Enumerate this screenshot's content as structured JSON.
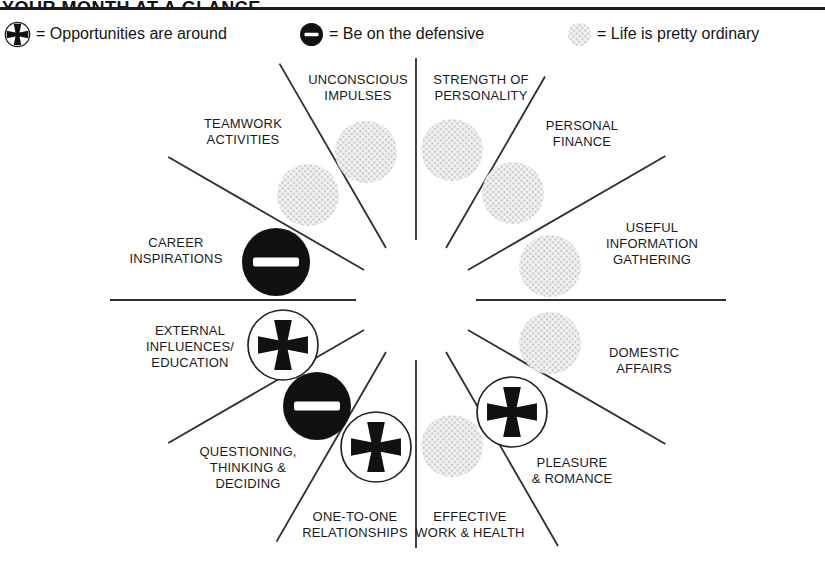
{
  "title": "YOUR MONTH AT A GLANCE",
  "legend": [
    {
      "icon": "plus-circle-icon",
      "meaning": "plus",
      "text": "= Opportunities are around"
    },
    {
      "icon": "minus-circle-icon",
      "meaning": "minus",
      "text": "= Be on the defensive"
    },
    {
      "icon": "ordinary-circle-icon",
      "meaning": "ordinary",
      "text": "= Life is pretty ordinary"
    }
  ],
  "colors": {
    "ink": "#1b1b1b",
    "line": "#2e2e2e",
    "minus_fill": "#111111",
    "plus_stroke": "#222222",
    "halftone_dot": "#bdbdbd"
  },
  "wheel": {
    "sectors": [
      {
        "id": "strength-of-personality",
        "label_lines": [
          "STRENGTH OF",
          "PERSONALITY"
        ],
        "symbol": "ordinary",
        "angle_deg": 75
      },
      {
        "id": "personal-finance",
        "label_lines": [
          "PERSONAL",
          "FINANCE"
        ],
        "symbol": "ordinary",
        "angle_deg": 45
      },
      {
        "id": "useful-information-gathering",
        "label_lines": [
          "USEFUL",
          "INFORMATION",
          "GATHERING"
        ],
        "symbol": "ordinary",
        "angle_deg": 15
      },
      {
        "id": "domestic-affairs",
        "label_lines": [
          "DOMESTIC",
          "AFFAIRS"
        ],
        "symbol": "ordinary",
        "angle_deg": -15
      },
      {
        "id": "pleasure-romance",
        "label_lines": [
          "PLEASURE",
          "& ROMANCE"
        ],
        "symbol": "plus",
        "angle_deg": -45
      },
      {
        "id": "effective-work-health",
        "label_lines": [
          "EFFECTIVE",
          "WORK & HEALTH"
        ],
        "symbol": "ordinary",
        "angle_deg": -75
      },
      {
        "id": "one-to-one-relationships",
        "label_lines": [
          "ONE-TO-ONE",
          "RELATIONSHIPS"
        ],
        "symbol": "plus",
        "angle_deg": -105
      },
      {
        "id": "questioning-thinking-deciding",
        "label_lines": [
          "QUESTIONING,",
          "THINKING &",
          "DECIDING"
        ],
        "symbol": "minus",
        "angle_deg": -135
      },
      {
        "id": "external-influences-education",
        "label_lines": [
          "EXTERNAL",
          "INFLUENCES/",
          "EDUCATION"
        ],
        "symbol": "plus",
        "angle_deg": -165
      },
      {
        "id": "career-inspirations",
        "label_lines": [
          "CAREER",
          "INSPIRATIONS"
        ],
        "symbol": "minus",
        "angle_deg": 165
      },
      {
        "id": "teamwork-activities",
        "label_lines": [
          "TEAMWORK",
          "ACTIVITIES"
        ],
        "symbol": "ordinary",
        "angle_deg": 135
      },
      {
        "id": "unconscious-impulses",
        "label_lines": [
          "UNCONSCIOUS",
          "IMPULSES"
        ],
        "symbol": "ordinary",
        "angle_deg": 105
      }
    ]
  }
}
